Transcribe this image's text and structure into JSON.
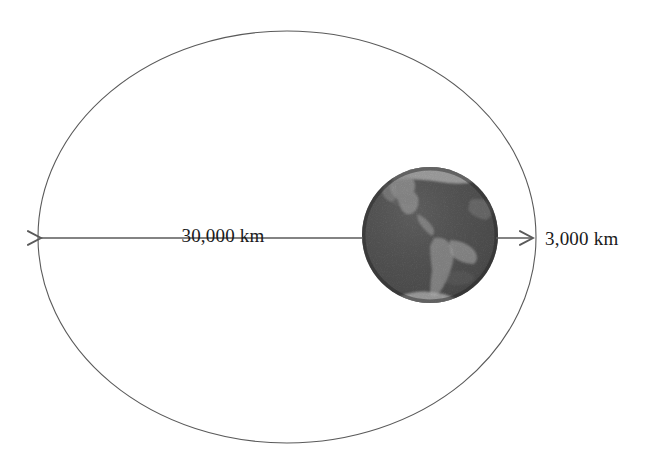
{
  "diagram": {
    "background_color": "#ffffff",
    "width": 654,
    "height": 467
  },
  "orbit": {
    "name": "orbit-ellipse",
    "stroke_color": "#5a5a5a",
    "stroke_width": 1.1,
    "fill": "none",
    "center_x": 287,
    "center_y": 237,
    "radius_x": 249,
    "radius_y": 206
  },
  "earth": {
    "name": "earth-globe",
    "center_x": 430,
    "center_y": 235,
    "radius": 68,
    "ocean_color": "#3f3f3f",
    "land_color": "#9a9a9a",
    "highlight_color": "#c8c8c8",
    "shadow_color": "#2b2b2b",
    "description": "Earth viewed from space showing the Americas"
  },
  "measurements": [
    {
      "id": "orbit-radius",
      "label": "30,000 km",
      "arrow_direction": "left",
      "line_y": 238,
      "line_x_start": 363,
      "line_x_end": 40,
      "label_x": 223,
      "label_y": 242,
      "label_anchor": "middle"
    },
    {
      "id": "earth-radius",
      "label": "3,000 km",
      "arrow_direction": "right",
      "line_y": 238,
      "line_x_start": 497,
      "line_x_end": 535,
      "label_x": 545,
      "label_y": 245,
      "label_anchor": "start"
    }
  ],
  "colors": {
    "line": "#5a5a5a",
    "text": "#1a1a1a",
    "background": "#ffffff"
  }
}
